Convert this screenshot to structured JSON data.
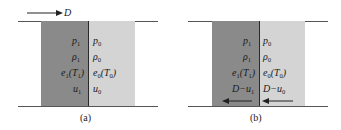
{
  "figure": {
    "colors": {
      "burned_region": "#8a8a8a",
      "unburned_region": "#d4d4d4",
      "lines": "#555555",
      "interface": "#2a2a2a",
      "text": "#1a1a1a"
    },
    "panels": [
      {
        "caption": "(a)",
        "top_arrow": {
          "direction": "right",
          "label": "D"
        },
        "left_region": {
          "rows": [
            {
              "sym": "p",
              "sub": "1",
              "suffix": ""
            },
            {
              "sym": "ρ",
              "sub": "1",
              "suffix": ""
            },
            {
              "sym": "e",
              "sub": "1",
              "suffix": "(T",
              "suffix_sub": "1",
              "suffix_end": ")"
            },
            {
              "sym": "u",
              "sub": "1",
              "suffix": ""
            }
          ]
        },
        "right_region": {
          "rows": [
            {
              "sym": "p",
              "sub": "0",
              "suffix": ""
            },
            {
              "sym": "ρ",
              "sub": "0",
              "suffix": ""
            },
            {
              "sym": "e",
              "sub": "0",
              "suffix": "(T",
              "suffix_sub": "0",
              "suffix_end": ")"
            },
            {
              "sym": "u",
              "sub": "0",
              "suffix": ""
            }
          ]
        }
      },
      {
        "caption": "(b)",
        "left_region": {
          "rows": [
            {
              "sym": "p",
              "sub": "1",
              "suffix": ""
            },
            {
              "sym": "ρ",
              "sub": "1",
              "suffix": ""
            },
            {
              "sym": "e",
              "sub": "1",
              "suffix": "(T",
              "suffix_sub": "1",
              "suffix_end": ")"
            },
            {
              "sym": "D−u",
              "sub": "1",
              "suffix": ""
            }
          ],
          "bottom_arrow": {
            "direction": "left"
          }
        },
        "right_region": {
          "rows": [
            {
              "sym": "p",
              "sub": "0",
              "suffix": ""
            },
            {
              "sym": "ρ",
              "sub": "0",
              "suffix": ""
            },
            {
              "sym": "e",
              "sub": "0",
              "suffix": "(T",
              "suffix_sub": "0",
              "suffix_end": ")"
            },
            {
              "sym": "D−u",
              "sub": "0",
              "suffix": ""
            }
          ],
          "bottom_arrow": {
            "direction": "left"
          }
        }
      }
    ]
  }
}
